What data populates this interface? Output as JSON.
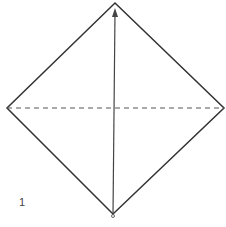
{
  "diagram": {
    "type": "origami-fold-step",
    "step_number": "1",
    "shape": "square-on-point",
    "fold_line": "valley-fold-horizontal-diagonal",
    "action": "fold bottom corner up to top corner",
    "colors": {
      "line": "#333333",
      "background": "#ffffff"
    }
  }
}
